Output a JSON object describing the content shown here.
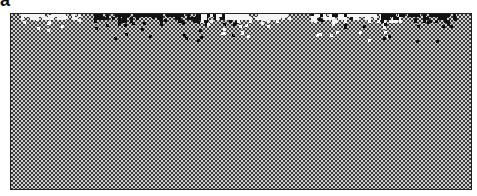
{
  "figure": {
    "panel_label": "a",
    "background": "dithered gray checkerboard",
    "colors": {
      "frame_border": "#222222",
      "dark": "#111111",
      "light": "#f5f5f5",
      "mid": "#808080"
    },
    "clusters": [
      {
        "tone": "light",
        "x": 10,
        "width": 60,
        "depth": 10
      },
      {
        "tone": "dark",
        "x": 80,
        "width": 150,
        "depth": 18
      },
      {
        "tone": "light",
        "x": 190,
        "width": 90,
        "depth": 16
      },
      {
        "tone": "dark",
        "x": 300,
        "width": 60,
        "depth": 10
      },
      {
        "tone": "light",
        "x": 300,
        "width": 90,
        "depth": 18
      },
      {
        "tone": "dark",
        "x": 370,
        "width": 75,
        "depth": 20
      }
    ]
  }
}
